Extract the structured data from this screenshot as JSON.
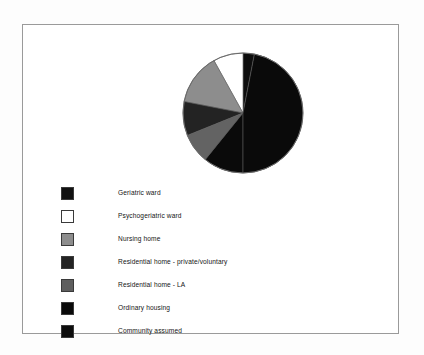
{
  "figure": {
    "background_color": "#ffffff",
    "frame_border_color": "#9a9a9a"
  },
  "chart_data": {
    "type": "pie",
    "title": "",
    "subtitle": "",
    "xlabel": "",
    "ylabel": "",
    "grid": false,
    "legend_position": "bottom-left",
    "start_angle_deg": 0,
    "direction": "clockwise",
    "categories": [
      "Geriatric ward",
      "Psychogeriatric ward",
      "Nursing home",
      "Residential home - private/voluntary",
      "Residential home - LA",
      "Ordinary housing",
      "Community assumed"
    ],
    "values": [
      3,
      8,
      14,
      9,
      8,
      28,
      30
    ],
    "unit": "percent",
    "slices": [
      {
        "label": "Geriatric ward",
        "value": 3,
        "color": "#0d0d0d",
        "start_deg": 0,
        "end_deg": 11
      },
      {
        "label": "Psychogeriatric ward",
        "value": 8,
        "color": "#ffffff",
        "start_deg": 331,
        "end_deg": 360
      },
      {
        "label": "Nursing home",
        "value": 14,
        "color": "#8d8d8d",
        "start_deg": 281,
        "end_deg": 331
      },
      {
        "label": "Residential home - private/voluntary",
        "value": 9,
        "color": "#232323",
        "start_deg": 248,
        "end_deg": 281
      },
      {
        "label": "Residential home - LA",
        "value": 8,
        "color": "#636363",
        "start_deg": 219,
        "end_deg": 248
      },
      {
        "label": "Ordinary housing",
        "value": 28,
        "color": "#0a0a0a",
        "start_deg": 180,
        "end_deg": 219
      },
      {
        "label": "Community assumed",
        "value": 30,
        "color": "#0a0a0a",
        "start_deg": 11,
        "end_deg": 180
      }
    ],
    "legend_entries": [
      {
        "label": "Geriatric ward",
        "color": "#111111"
      },
      {
        "label": "Psychogeriatric ward",
        "color": "#ffffff"
      },
      {
        "label": "Nursing home",
        "color": "#8d8d8d"
      },
      {
        "label": "Residential home - private/voluntary",
        "color": "#232323"
      },
      {
        "label": "Residential home - LA",
        "color": "#5e5e5e"
      },
      {
        "label": "Ordinary housing",
        "color": "#0a0a0a"
      },
      {
        "label": "Community assumed",
        "color": "#0d0d0d"
      }
    ]
  }
}
